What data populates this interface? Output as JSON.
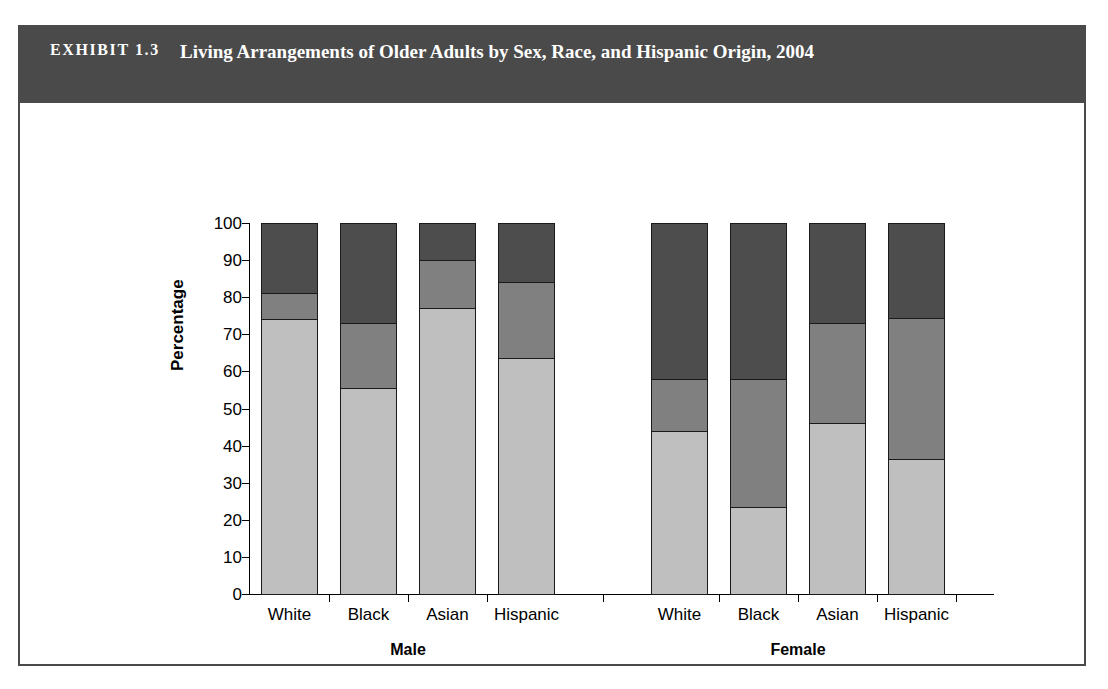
{
  "exhibit": {
    "label": "EXHIBIT 1.3",
    "title": "Living Arrangements of Older Adults by Sex, Race, and Hispanic Origin, 2004"
  },
  "colors": {
    "header_bg": "#4a4a4a",
    "alone": "#4d4d4d",
    "with_others": "#808080",
    "with_spouse": "#bfbfbf",
    "axis": "#000000"
  },
  "chart_data": {
    "type": "bar",
    "stacked": true,
    "title": "Living Arrangements of Older Adults by Sex, Race, and Hispanic Origin, 2004",
    "xlabel": "",
    "ylabel": "Percentage",
    "ylim": [
      0,
      100
    ],
    "yticks": [
      0,
      10,
      20,
      30,
      40,
      50,
      60,
      70,
      80,
      90,
      100
    ],
    "grid": false,
    "legend_position": "bottom",
    "groups": [
      "Male",
      "Female"
    ],
    "categories": [
      "White",
      "Black",
      "Asian",
      "Hispanic",
      "White",
      "Black",
      "Asian",
      "Hispanic"
    ],
    "category_groups": [
      "Male",
      "Male",
      "Male",
      "Male",
      "Female",
      "Female",
      "Female",
      "Female"
    ],
    "series": [
      {
        "name": "With spouse",
        "color": "#bfbfbf",
        "values": [
          74,
          55.5,
          77,
          63.5,
          44,
          23.5,
          46,
          36.5
        ]
      },
      {
        "name": "With others",
        "color": "#808080",
        "values": [
          7,
          17.5,
          13,
          20.5,
          14,
          34.5,
          27,
          38
        ]
      },
      {
        "name": "Alone",
        "color": "#4d4d4d",
        "values": [
          19,
          27,
          10,
          16,
          42,
          42,
          27,
          25.5
        ]
      }
    ],
    "legend": [
      "Alone",
      "With others",
      "With spouse"
    ]
  }
}
